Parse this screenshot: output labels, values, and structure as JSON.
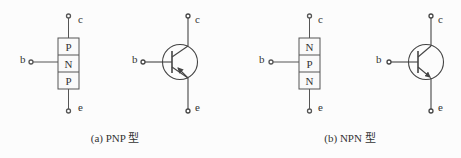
{
  "diagrams": [
    {
      "id": "pnp",
      "caption": "(a) PNP 型",
      "structure": {
        "layers": [
          "P",
          "N",
          "P"
        ]
      },
      "terminals": {
        "collector": "c",
        "base": "b",
        "emitter": "e"
      },
      "symbol": {
        "arrow": "emitter-inward"
      }
    },
    {
      "id": "npn",
      "caption": "(b) NPN 型",
      "structure": {
        "layers": [
          "N",
          "P",
          "N"
        ]
      },
      "terminals": {
        "collector": "c",
        "base": "b",
        "emitter": "e"
      },
      "symbol": {
        "arrow": "emitter-outward"
      }
    }
  ],
  "colors": {
    "line": "#444444",
    "text": "#333333",
    "background": "#fcfcfc"
  }
}
